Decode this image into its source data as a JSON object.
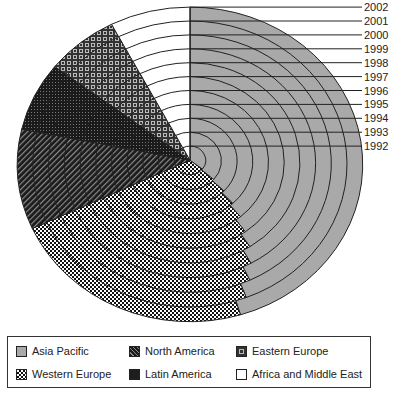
{
  "chart_data": {
    "type": "pie",
    "subtype": "concentric-rings-by-year",
    "title": "",
    "years": [
      "1992",
      "1993",
      "1994",
      "1995",
      "1996",
      "1997",
      "1998",
      "1999",
      "2000",
      "2001",
      "2002"
    ],
    "series_order": [
      "Asia Pacific",
      "Western Europe",
      "North America",
      "Latin America",
      "Eastern Europe",
      "Africa and Middle East"
    ],
    "fixed_boundaries_deg_clockwise_from_top": {
      "Western Europe_end": 246,
      "North America_end": 283,
      "Latin America_end": 308.5,
      "Eastern Europe_end": 333,
      "Africa and Middle East_end": 360
    },
    "asia_pacific_end_deg_by_year": [
      128,
      131,
      134,
      137,
      140,
      144,
      147,
      151,
      155,
      159,
      163
    ],
    "approx_share_percent_2002": {
      "Asia Pacific": 45,
      "Western Europe": 23,
      "North America": 10.5,
      "Latin America": 7,
      "Eastern Europe": 7,
      "Africa and Middle East": 7.5
    },
    "approx_share_percent_1992": {
      "Asia Pacific": 35.5,
      "Western Europe": 32.8,
      "North America": 10.5,
      "Latin America": 7,
      "Eastern Europe": 7,
      "Africa and Middle East": 7.5
    },
    "legend": [
      {
        "label": "Asia Pacific",
        "pattern": "solid-gray"
      },
      {
        "label": "North America",
        "pattern": "diagonal-stripes"
      },
      {
        "label": "Eastern Europe",
        "pattern": "squares-grid"
      },
      {
        "label": "Western Europe",
        "pattern": "checkerboard"
      },
      {
        "label": "Latin America",
        "pattern": "dark-dots"
      },
      {
        "label": "Africa and Middle East",
        "pattern": "white"
      }
    ],
    "legend_position": "bottom"
  },
  "colors": {
    "asia_pacific": "#a9a9a9",
    "outline": "#222222",
    "background": "#ffffff"
  },
  "legend": {
    "items": [
      {
        "label": "Asia Pacific"
      },
      {
        "label": "North America"
      },
      {
        "label": "Eastern Europe"
      },
      {
        "label": "Western Europe"
      },
      {
        "label": "Latin America"
      },
      {
        "label": "Africa and Middle East"
      }
    ]
  }
}
